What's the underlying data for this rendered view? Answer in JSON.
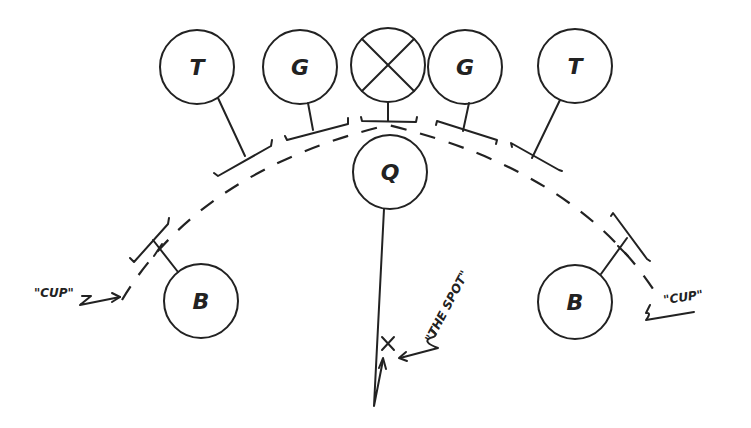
{
  "diagram": {
    "title": "",
    "players": {
      "tackle_left": "T",
      "guard_left": "G",
      "center": "⊗",
      "guard_right": "G",
      "tackle_right": "T",
      "quarterback": "Q",
      "back_left": "B",
      "back_right": "B"
    },
    "annotations": {
      "cup_left": "\"CUP\"",
      "cup_right": "\"CUP\"",
      "the_spot": "\"THE SPOT\"",
      "spot_marker": "×"
    },
    "colors": {
      "ink": "#222222",
      "background": "#ffffff"
    }
  }
}
